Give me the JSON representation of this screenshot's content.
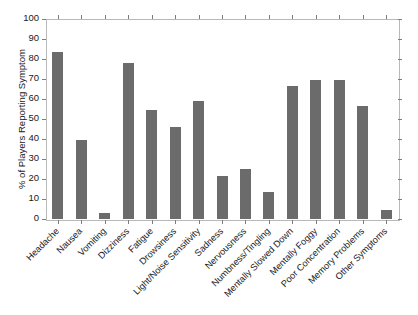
{
  "chart_data": {
    "type": "bar",
    "title": "",
    "xlabel": "",
    "ylabel": "% of Players Reporting Symptom",
    "ylim": [
      0,
      100
    ],
    "yticks": [
      0,
      10,
      20,
      30,
      40,
      50,
      60,
      70,
      80,
      90,
      100
    ],
    "grid": false,
    "legend": "none",
    "bar_color": "#6b6b6b",
    "frame_color": "#b9b9b9",
    "categories": [
      "Headache",
      "Nausea",
      "Vomiting",
      "Dizziness",
      "Fatigue",
      "Drowsiness",
      "Light/Noise Sensitivity",
      "Sadness",
      "Nervousness",
      "Numbness/Tingling",
      "Mentally Slowed Down",
      "Mentally Foggy",
      "Poor Concentration",
      "Memory Problems",
      "Other Symptoms"
    ],
    "values": [
      83.5,
      39.5,
      3,
      78,
      54.5,
      46,
      59,
      21.5,
      25,
      13.5,
      66.5,
      69.5,
      69.5,
      56.5,
      4.5
    ]
  }
}
